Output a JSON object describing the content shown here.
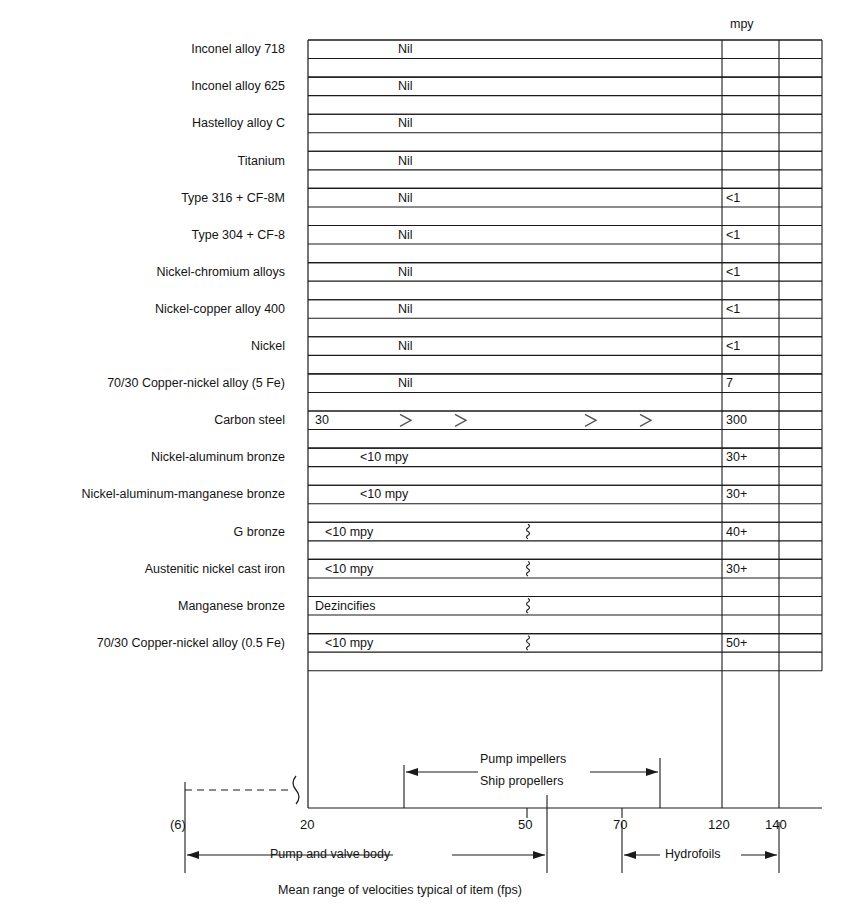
{
  "figure": {
    "axis_caption": "Mean range of velocities typical of item (fps)",
    "mpy_header": "mpy",
    "break_label": "(6)"
  },
  "chart_data": {
    "type": "bar",
    "title": "",
    "subtitle": "",
    "xlabel": "Mean range of velocities typical of item (fps)",
    "ylabel": "",
    "xlim": [
      20,
      152
    ],
    "xticks": [
      20,
      50,
      70,
      120,
      140
    ],
    "xticklabels": [
      "20",
      "50",
      "70",
      "120",
      "140"
    ],
    "grid": false,
    "gridlines_x": [
      120,
      140
    ],
    "value_column_header": "mpy",
    "categories": [
      "Inconel alloy 718",
      "Inconel alloy 625",
      "Hastelloy alloy C",
      "Titanium",
      "Type 316 + CF-8M",
      "Type 304 + CF-8",
      "Nickel-chromium alloys",
      "Nickel-copper alloy 400",
      "Nickel",
      "70/30 Copper-nickel alloy (5 Fe)",
      "Carbon steel",
      "Nickel-aluminum bronze",
      "Nickel-aluminum-manganese bronze",
      "G bronze",
      "Austenitic nickel cast iron",
      "Manganese bronze",
      "70/30 Copper-nickel alloy (0.5 Fe)"
    ],
    "rows": [
      {
        "label": "Inconel alloy 718",
        "corrosion": "Nil",
        "mpy": "",
        "break_mark": false,
        "chevrons": false
      },
      {
        "label": "Inconel alloy 625",
        "corrosion": "Nil",
        "mpy": "",
        "break_mark": false,
        "chevrons": false
      },
      {
        "label": "Hastelloy alloy C",
        "corrosion": "Nil",
        "mpy": "",
        "break_mark": false,
        "chevrons": false
      },
      {
        "label": "Titanium",
        "corrosion": "Nil",
        "mpy": "",
        "break_mark": false,
        "chevrons": false
      },
      {
        "label": "Type 316 + CF-8M",
        "corrosion": "Nil",
        "mpy": "<1",
        "break_mark": false,
        "chevrons": false
      },
      {
        "label": "Type 304 + CF-8",
        "corrosion": "Nil",
        "mpy": "<1",
        "break_mark": false,
        "chevrons": false
      },
      {
        "label": "Nickel-chromium alloys",
        "corrosion": "Nil",
        "mpy": "<1",
        "break_mark": false,
        "chevrons": false
      },
      {
        "label": "Nickel-copper alloy 400",
        "corrosion": "Nil",
        "mpy": "<1",
        "break_mark": false,
        "chevrons": false
      },
      {
        "label": "Nickel",
        "corrosion": "Nil",
        "mpy": "<1",
        "break_mark": false,
        "chevrons": false
      },
      {
        "label": "70/30 Copper-nickel alloy (5 Fe)",
        "corrosion": "Nil",
        "mpy": "7",
        "break_mark": false,
        "chevrons": false
      },
      {
        "label": "Carbon steel",
        "corrosion": "30",
        "mpy": "300",
        "break_mark": false,
        "chevrons": true
      },
      {
        "label": "Nickel-aluminum bronze",
        "corrosion": "<10 mpy",
        "mpy": "30+",
        "break_mark": false,
        "chevrons": false
      },
      {
        "label": "Nickel-aluminum-manganese bronze",
        "corrosion": "<10 mpy",
        "mpy": "30+",
        "break_mark": false,
        "chevrons": false
      },
      {
        "label": "G bronze",
        "corrosion": "<10 mpy",
        "mpy": "40+",
        "break_mark": true,
        "chevrons": false
      },
      {
        "label": "Austenitic nickel cast iron",
        "corrosion": "<10 mpy",
        "mpy": "30+",
        "break_mark": true,
        "chevrons": false
      },
      {
        "label": "Manganese bronze",
        "corrosion": "Dezincifies",
        "mpy": "",
        "break_mark": true,
        "chevrons": false
      },
      {
        "label": "70/30 Copper-nickel alloy (0.5 Fe)",
        "corrosion": "<10 mpy",
        "mpy": "50+",
        "break_mark": true,
        "chevrons": false
      }
    ],
    "annotations": [
      {
        "name": "pump-impellers",
        "text": "Pump impellers",
        "from": 37,
        "to": 78
      },
      {
        "name": "ship-propellers",
        "text": "Ship propellers",
        "from": 37,
        "to": 78
      },
      {
        "name": "pump-valve-body",
        "text": "Pump and valve body",
        "from": 6,
        "to": 53
      },
      {
        "name": "hydrofoils",
        "text": "Hydrofoils",
        "from": 70,
        "to": 140
      }
    ]
  }
}
